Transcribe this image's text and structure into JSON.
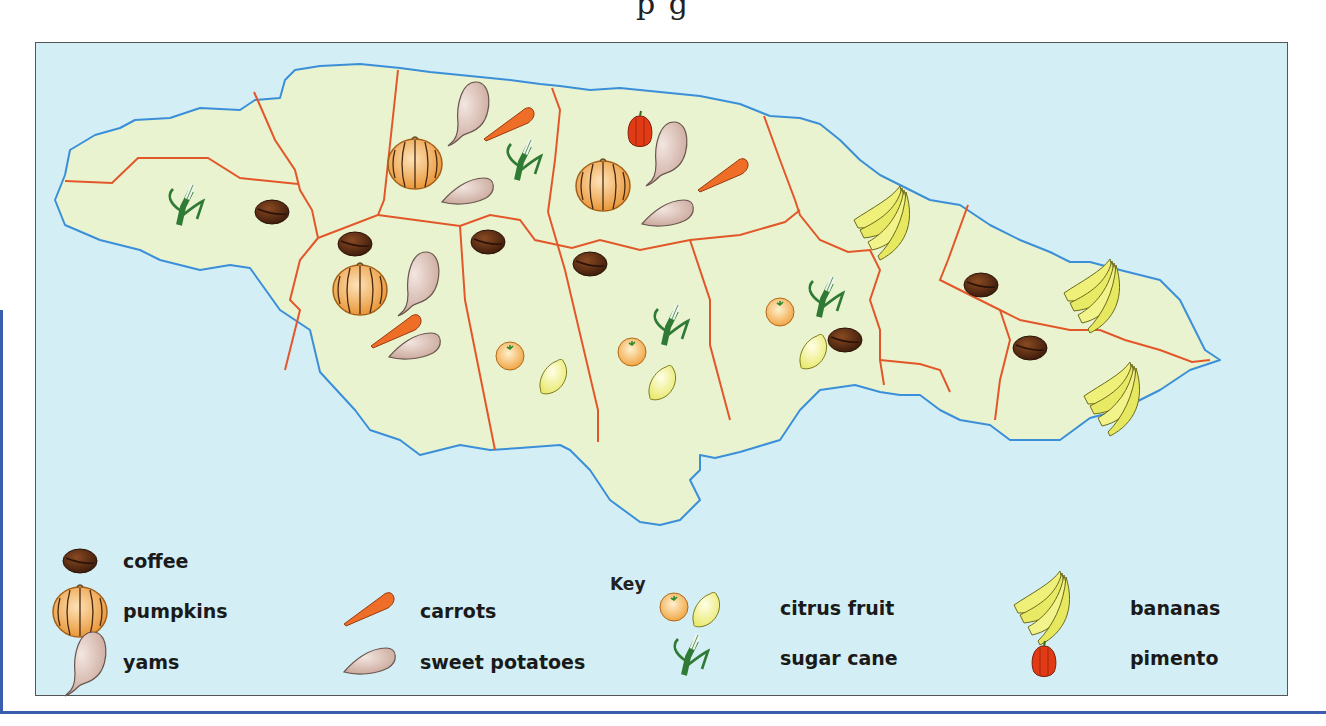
{
  "title_fragment": "p       g",
  "map": {
    "colors": {
      "sea": "#d3eff5",
      "land": "#eaf3cf",
      "coast": "#3a8fd8",
      "border": "#e2572a"
    }
  },
  "key": {
    "title": "Key",
    "items": [
      {
        "icon": "coffee-bean-icon",
        "label": "coffee"
      },
      {
        "icon": "pumpkin-icon",
        "label": "pumpkins"
      },
      {
        "icon": "yam-icon",
        "label": "yams"
      },
      {
        "icon": "carrot-icon",
        "label": "carrots"
      },
      {
        "icon": "sweet-potato-icon",
        "label": "sweet potatoes"
      },
      {
        "icon": "citrus-icon",
        "label": "citrus fruit"
      },
      {
        "icon": "sugar-cane-icon",
        "label": "sugar cane"
      },
      {
        "icon": "banana-icon",
        "label": "bananas"
      },
      {
        "icon": "pimento-icon",
        "label": "pimento"
      }
    ]
  }
}
